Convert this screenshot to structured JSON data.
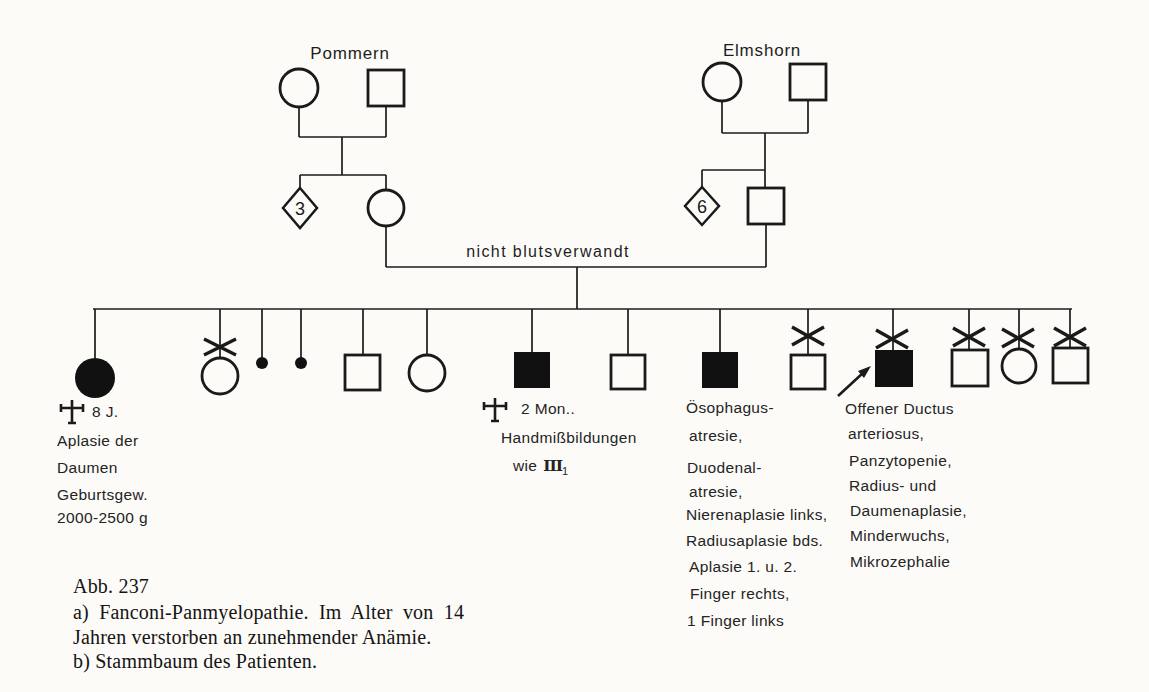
{
  "pedigree": {
    "left_origin_label": "Pommern",
    "right_origin_label": "Elmshorn",
    "left_sibs_count": "3",
    "right_sibs_count": "6",
    "marriage_note": "nicht blutsverwandt",
    "individuals": {
      "gen1_pommern": [
        "female-unaffected-circle",
        "male-unaffected-square"
      ],
      "gen1_elmshorn": [
        "female-unaffected-circle",
        "male-unaffected-square"
      ],
      "gen2": [
        "sibship-diamond-3",
        "mother-circle",
        "sibship-diamond-6",
        "father-square"
      ],
      "gen3_children_left_to_right": [
        "female-affected-filled-died-8y",
        "female-deceased-x",
        "miscarriage-dot",
        "miscarriage-dot",
        "male-unaffected",
        "female-unaffected",
        "male-affected-filled-died-2-months",
        "male-unaffected",
        "male-affected-filled",
        "male-deceased-x",
        "male-affected-filled-deceased-x-proband-arrow",
        "male-deceased-x",
        "female-deceased-x",
        "male-deceased-x"
      ]
    }
  },
  "annotations": {
    "child1": {
      "age": "8 J.",
      "lines": [
        "Aplasie der",
        "Daumen",
        "Geburtsgew.",
        "2000-2500 g"
      ]
    },
    "child7": {
      "age": "2 Mon..",
      "line1": "Handmißbildungen",
      "line2_prefix": "wie",
      "line2_roman": "III",
      "line2_sub": "1"
    },
    "child9": {
      "lines": [
        "Ösophagus-",
        "atresie,",
        "Duodenal-",
        "atresie,",
        "Nierenaplasie links,",
        "Radiusaplasie bds.",
        "Aplasie 1. u. 2.",
        "Finger rechts,",
        "1 Finger links"
      ]
    },
    "child11": {
      "lines": [
        "Offener Ductus",
        "arteriosus,",
        "Panzytopenie,",
        "Radius- und",
        "Daumenaplasie,",
        "Minderwuchs,",
        "Mikrozephalie"
      ]
    }
  },
  "caption": {
    "number": "Abb. 237",
    "line_a1": "a) Fanconi-Panmyelopathie. Im Alter von 14",
    "line_a2": "Jahren verstorben an zunehmender Anämie.",
    "line_b": "b) Stammbaum des Patienten."
  },
  "colors": {
    "ink": "#1a1a1a",
    "paper": "#fcfbf8"
  }
}
